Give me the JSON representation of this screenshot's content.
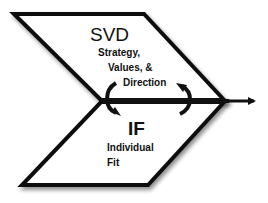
{
  "diagram": {
    "top_shape": {
      "title": "SVD",
      "lines": [
        "Strategy,",
        "Values, &",
        "Direction"
      ]
    },
    "bottom_shape": {
      "title": "IF",
      "lines": [
        "Individual",
        "Fit"
      ]
    },
    "colors": {
      "stroke": "#111111",
      "fill": "#ffffff",
      "shadow": "#9a9a9a"
    }
  }
}
